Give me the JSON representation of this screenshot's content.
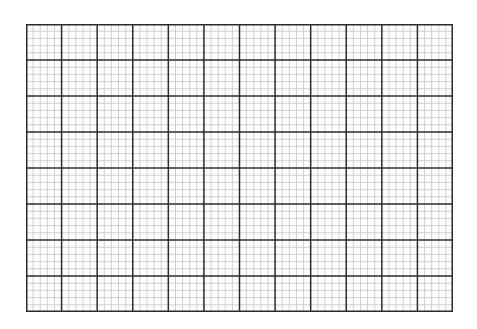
{
  "graph_paper": {
    "major_columns": 12,
    "major_rows": 8,
    "minor_divisions": 5,
    "colors": {
      "background": "#ffffff",
      "major_line": "#2b2b2b",
      "minor_line": "#c4c4c4",
      "border": "#2b2b2b"
    }
  }
}
